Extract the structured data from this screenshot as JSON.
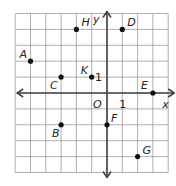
{
  "chart_data": {
    "type": "scatter",
    "title": "",
    "xlabel": "x",
    "ylabel": "y",
    "origin_label": "O",
    "xlim": [
      -6,
      4
    ],
    "ylim": [
      -5,
      5
    ],
    "grid": true,
    "tick_labels": {
      "x": [
        {
          "value": 1,
          "text": "1"
        }
      ],
      "y": [
        {
          "value": 1,
          "text": "1"
        }
      ]
    },
    "points": [
      {
        "name": "A",
        "x": -5,
        "y": 2
      },
      {
        "name": "B",
        "x": -3,
        "y": -2
      },
      {
        "name": "C",
        "x": -3,
        "y": 1
      },
      {
        "name": "D",
        "x": 1,
        "y": 4
      },
      {
        "name": "E",
        "x": 3,
        "y": 0
      },
      {
        "name": "F",
        "x": 0,
        "y": -2
      },
      {
        "name": "G",
        "x": 2,
        "y": -4
      },
      {
        "name": "H",
        "x": -2,
        "y": 4
      },
      {
        "name": "K",
        "x": -1,
        "y": 1
      }
    ],
    "colors": {
      "grid": "#9a9a9a",
      "axis": "#444444",
      "point": "#111111",
      "background": "#ffffff"
    }
  }
}
